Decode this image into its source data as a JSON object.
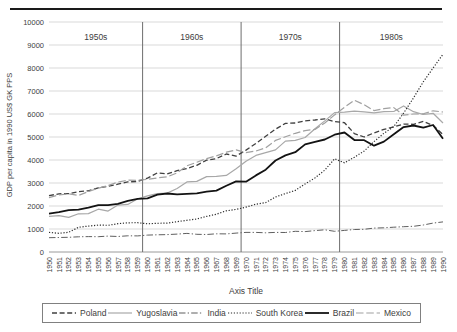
{
  "page": {
    "top_border_color": "#1a1a1a",
    "background": "#ffffff"
  },
  "chart_data": {
    "type": "line",
    "title": "",
    "xlabel": "Axis Title",
    "ylabel": "GDP per capita in 1990 US$ GK PPS",
    "ylim": [
      0,
      10000
    ],
    "ytick_interval": 1000,
    "yticks": [
      0,
      1000,
      2000,
      3000,
      4000,
      5000,
      6000,
      7000,
      8000,
      9000,
      10000
    ],
    "grid": "horizontal",
    "gridline_color": "#d9d9d9",
    "axis_line_color": "#9a9a9a",
    "decade_separator_color": "#6e6e6e",
    "legend_position": "bottom",
    "decade_labels": [
      "1950s",
      "1960s",
      "1970s",
      "1980s"
    ],
    "decade_separators_at": [
      1959.5,
      1969.5,
      1979.5
    ],
    "years": [
      1950,
      1951,
      1952,
      1953,
      1954,
      1955,
      1956,
      1957,
      1958,
      1959,
      1960,
      1961,
      1962,
      1963,
      1964,
      1965,
      1966,
      1967,
      1968,
      1969,
      1970,
      1971,
      1972,
      1973,
      1974,
      1975,
      1976,
      1977,
      1978,
      1979,
      1980,
      1981,
      1982,
      1983,
      1984,
      1985,
      1986,
      1987,
      1988,
      1989,
      1990
    ],
    "series": [
      {
        "name": "Poland",
        "style": "dash",
        "color": "#404040",
        "width": 1.3,
        "values": [
          2450,
          2530,
          2540,
          2620,
          2660,
          2790,
          2850,
          2950,
          3050,
          3070,
          3215,
          3440,
          3390,
          3540,
          3630,
          3770,
          3990,
          4060,
          4260,
          4170,
          4430,
          4720,
          5030,
          5340,
          5590,
          5610,
          5700,
          5740,
          5790,
          5670,
          5620,
          5150,
          5000,
          5180,
          5330,
          5440,
          5560,
          5550,
          5680,
          5500,
          5110
        ]
      },
      {
        "name": "Yugoslavia",
        "style": "solid",
        "color": "#a8a8a8",
        "width": 1.2,
        "values": [
          1550,
          1580,
          1505,
          1660,
          1670,
          1860,
          1780,
          2040,
          2070,
          2315,
          2440,
          2540,
          2560,
          2760,
          3050,
          3070,
          3280,
          3290,
          3330,
          3620,
          3945,
          4200,
          4320,
          4440,
          4820,
          4850,
          4980,
          5360,
          5700,
          6060,
          6080,
          6120,
          6090,
          6050,
          6100,
          6110,
          6350,
          6100,
          5980,
          6030,
          5610
        ]
      },
      {
        "name": "India",
        "style": "dashdot",
        "color": "#5f5f5f",
        "width": 1.0,
        "values": [
          620,
          630,
          640,
          660,
          670,
          665,
          690,
          675,
          705,
          700,
          735,
          750,
          757,
          778,
          808,
          771,
          762,
          790,
          789,
          823,
          853,
          850,
          834,
          853,
          848,
          900,
          889,
          932,
          966,
          902,
          938,
          977,
          988,
          1037,
          1051,
          1079,
          1102,
          1119,
          1174,
          1256,
          1309
        ]
      },
      {
        "name": "South Korea",
        "style": "dot",
        "color": "#2b2b2b",
        "width": 1.2,
        "values": [
          854,
          813,
          857,
          1072,
          1127,
          1169,
          1163,
          1230,
          1271,
          1272,
          1226,
          1247,
          1255,
          1316,
          1380,
          1436,
          1547,
          1645,
          1790,
          1850,
          1954,
          2080,
          2150,
          2390,
          2540,
          2680,
          2960,
          3220,
          3560,
          4050,
          3880,
          4120,
          4390,
          4800,
          5160,
          5450,
          6040,
          6700,
          7400,
          8000,
          8600
        ]
      },
      {
        "name": "Brazil",
        "style": "solid",
        "color": "#131313",
        "width": 1.8,
        "values": [
          1670,
          1730,
          1820,
          1840,
          1930,
          2035,
          2035,
          2090,
          2220,
          2310,
          2335,
          2490,
          2545,
          2510,
          2530,
          2550,
          2620,
          2670,
          2880,
          3070,
          3057,
          3330,
          3580,
          3980,
          4200,
          4340,
          4680,
          4790,
          4890,
          5100,
          5195,
          4870,
          4860,
          4620,
          4800,
          5120,
          5430,
          5500,
          5410,
          5520,
          4920
        ]
      },
      {
        "name": "Mexico",
        "style": "longdash",
        "color": "#a0a0a0",
        "width": 1.2,
        "values": [
          2365,
          2480,
          2530,
          2460,
          2630,
          2770,
          2890,
          3040,
          3120,
          3118,
          3155,
          3220,
          3270,
          3440,
          3750,
          3900,
          4060,
          4180,
          4340,
          4440,
          4320,
          4390,
          4530,
          4850,
          5010,
          5160,
          5280,
          5330,
          5610,
          5960,
          6290,
          6600,
          6400,
          6150,
          6230,
          6280,
          5950,
          6000,
          6010,
          6140,
          6085
        ]
      }
    ]
  }
}
